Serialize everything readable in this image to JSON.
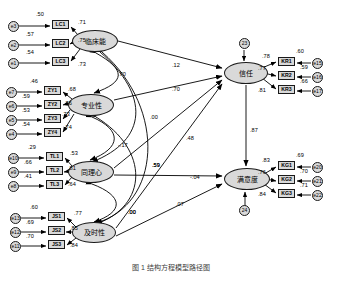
{
  "diagram": {
    "title_caption": "图 1  结构方程模型路径图",
    "latent_exogenous": [
      {
        "id": "clinical",
        "label": "临床能",
        "x": 72,
        "y": 30,
        "w": 46,
        "h": 22
      },
      {
        "id": "professional",
        "label": "专业性",
        "x": 68,
        "y": 94,
        "w": 46,
        "h": 22
      },
      {
        "id": "empathy",
        "label": "同理心",
        "x": 68,
        "y": 161,
        "w": 46,
        "h": 22
      },
      {
        "id": "timeliness",
        "label": "及时性",
        "x": 72,
        "y": 222,
        "w": 44,
        "h": 21
      }
    ],
    "latent_endogenous": [
      {
        "id": "trust",
        "label": "信任",
        "x": 224,
        "y": 62,
        "w": 44,
        "h": 22,
        "disturbance": "23",
        "disturbance_x": 239,
        "disturbance_y": 38
      },
      {
        "id": "satisfaction",
        "label": "满意度",
        "x": 224,
        "y": 168,
        "w": 46,
        "h": 22,
        "disturbance": "24",
        "disturbance_x": 239,
        "disturbance_y": 205
      }
    ],
    "indicator_groups": [
      {
        "construct": "clinical",
        "indicators": [
          {
            "name": "LC1",
            "err": "e3",
            "r2": ".50",
            "loading": ".71",
            "x": 52,
            "y": 20,
            "ex": 8,
            "ey": 21,
            "r2x": 36,
            "r2y": 12,
            "lx": 78,
            "ly": 20
          },
          {
            "name": "LC2",
            "err": "e2",
            "r2": ".57",
            "loading": ".75",
            "x": 52,
            "y": 39,
            "ex": 8,
            "ey": 40,
            "r2x": 26,
            "r2y": 32,
            "lx": 78,
            "ly": 38
          },
          {
            "name": "LC3",
            "err": "e1",
            "r2": ".54",
            "loading": ".73",
            "x": 52,
            "y": 57,
            "ex": 8,
            "ey": 58,
            "r2x": 26,
            "r2y": 50,
            "lx": 78,
            "ly": 62
          }
        ]
      },
      {
        "construct": "professional",
        "indicators": [
          {
            "name": "ZY1",
            "err": "e7",
            "r2": ".46",
            "loading": ".68",
            "x": 44,
            "y": 86,
            "ex": 6,
            "ey": 87,
            "r2x": 30,
            "r2y": 79,
            "lx": 68,
            "ly": 87
          },
          {
            "name": "ZY2",
            "err": "e6",
            "r2": ".59",
            "loading": ".76",
            "x": 44,
            "y": 100,
            "ex": 6,
            "ey": 101,
            "r2x": 22,
            "r2y": 94,
            "lx": 64,
            "ly": 101
          },
          {
            "name": "ZY3",
            "err": "e5",
            "r2": ".53",
            "loading": ".73",
            "x": 44,
            "y": 114,
            "ex": 6,
            "ey": 115,
            "r2x": 22,
            "r2y": 108,
            "lx": 62,
            "ly": 112
          },
          {
            "name": "ZY4",
            "err": "e4",
            "r2": ".54",
            "loading": ".74",
            "x": 44,
            "y": 128,
            "ex": 6,
            "ey": 129,
            "r2x": 22,
            "r2y": 122,
            "lx": 64,
            "ly": 125
          }
        ]
      },
      {
        "construct": "empathy",
        "indicators": [
          {
            "name": "TL1",
            "err": "e10",
            "r2": ".29",
            "loading": ".53",
            "x": 46,
            "y": 152,
            "ex": 8,
            "ey": 153,
            "r2x": 28,
            "r2y": 145,
            "lx": 70,
            "ly": 151
          },
          {
            "name": "TL2",
            "err": "e9",
            "r2": ".66",
            "loading": ".81",
            "x": 46,
            "y": 166,
            "ex": 8,
            "ey": 167,
            "r2x": 24,
            "r2y": 160,
            "lx": 68,
            "ly": 166
          },
          {
            "name": "TL3",
            "err": "e8",
            "r2": ".41",
            "loading": ".64",
            "x": 46,
            "y": 180,
            "ex": 8,
            "ey": 181,
            "r2x": 24,
            "r2y": 174,
            "lx": 68,
            "ly": 182
          }
        ]
      },
      {
        "construct": "timeliness",
        "indicators": [
          {
            "name": "JS1",
            "err": "e13",
            "r2": ".60",
            "loading": ".77",
            "x": 48,
            "y": 212,
            "ex": 10,
            "ey": 213,
            "r2x": 30,
            "r2y": 205,
            "lx": 74,
            "ly": 211
          },
          {
            "name": "JS2",
            "err": "e12",
            "r2": ".69",
            "loading": ".85",
            "x": 48,
            "y": 226,
            "ex": 10,
            "ey": 227,
            "r2x": 26,
            "r2y": 220,
            "lx": 70,
            "ly": 226
          },
          {
            "name": "JS3",
            "err": "e11",
            "r2": ".70",
            "loading": ".84",
            "x": 48,
            "y": 240,
            "ex": 10,
            "ey": 241,
            "r2x": 26,
            "r2y": 234,
            "lx": 70,
            "ly": 243
          }
        ]
      },
      {
        "construct": "trust",
        "indicators": [
          {
            "name": "KR1",
            "err": "e15",
            "r2": ".60",
            "loading": ".78",
            "x": 278,
            "y": 57,
            "ex": 312,
            "ey": 58,
            "r2x": 296,
            "r2y": 49,
            "lx": 262,
            "ly": 54
          },
          {
            "name": "KR2",
            "err": "e16",
            "r2": ".59",
            "loading": ".77",
            "x": 278,
            "y": 71,
            "ex": 312,
            "ey": 72,
            "r2x": 300,
            "r2y": 65,
            "lx": 258,
            "ly": 66
          },
          {
            "name": "KR3",
            "err": "e17",
            "r2": ".66",
            "loading": ".81",
            "x": 278,
            "y": 85,
            "ex": 312,
            "ey": 86,
            "r2x": 300,
            "r2y": 79,
            "lx": 258,
            "ly": 88
          }
        ]
      },
      {
        "construct": "satisfaction",
        "indicators": [
          {
            "name": "KG1",
            "err": "e20",
            "r2": ".69",
            "loading": ".83",
            "x": 278,
            "y": 161,
            "ex": 312,
            "ey": 162,
            "r2x": 296,
            "r2y": 153,
            "lx": 262,
            "ly": 158
          },
          {
            "name": "KG2",
            "err": "e21",
            "r2": ".70",
            "loading": ".76",
            "x": 278,
            "y": 175,
            "ex": 312,
            "ey": 176,
            "r2x": 300,
            "r2y": 169,
            "lx": 258,
            "ly": 170
          },
          {
            "name": "KG3",
            "err": "e22",
            "r2": ".71",
            "loading": ".84",
            "x": 278,
            "y": 189,
            "ex": 312,
            "ey": 190,
            "r2x": 300,
            "r2y": 183,
            "lx": 258,
            "ly": 192
          }
        ]
      }
    ],
    "structural_paths": [
      {
        "from": "clinical",
        "to": "trust",
        "value": ".12",
        "x": 172,
        "y": 63
      },
      {
        "from": "professional",
        "to": "trust",
        "value": ".70",
        "x": 172,
        "y": 87
      },
      {
        "from": "empathy",
        "to": "trust",
        "value": ".48",
        "x": 186,
        "y": 136
      },
      {
        "from": "timeliness",
        "to": "trust",
        "value": ".59",
        "x": 152,
        "y": 163
      },
      {
        "from": "empathy",
        "to": "satisfaction",
        "value": "-.04",
        "x": 190,
        "y": 175
      },
      {
        "from": "timeliness",
        "to": "satisfaction",
        "value": ".07",
        "x": 176,
        "y": 202
      },
      {
        "from": "trust",
        "to": "satisfaction",
        "value": ".87",
        "x": 250,
        "y": 128
      }
    ],
    "correlations": [
      {
        "between": [
          "clinical",
          "professional"
        ],
        "value": ".70",
        "x": 118,
        "y": 72
      },
      {
        "between": [
          "clinical",
          "empathy"
        ],
        "value": ".00",
        "x": 150,
        "y": 115
      },
      {
        "between": [
          "clinical",
          "timeliness"
        ],
        "value": ".00",
        "x": 128,
        "y": 210
      },
      {
        "between": [
          "professional",
          "empathy"
        ],
        "value": "-.17",
        "x": 118,
        "y": 143
      },
      {
        "between": [
          "professional",
          "timeliness"
        ],
        "value": ".59",
        "x": 152,
        "y": 163
      },
      {
        "between": [
          "empathy",
          "timeliness"
        ],
        "value": ".00",
        "x": 128,
        "y": 210
      }
    ]
  }
}
